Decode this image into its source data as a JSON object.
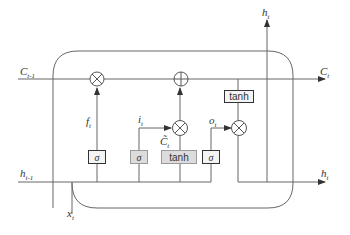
{
  "diagram": {
    "type": "LSTM cell",
    "labels": {
      "c_prev": {
        "base": "C",
        "sub": "t-1"
      },
      "c_next": {
        "base": "C",
        "sub": "t"
      },
      "h_prev": {
        "base": "h",
        "sub": "t-1"
      },
      "h_out_right": {
        "base": "h",
        "sub": "t"
      },
      "h_out_top": {
        "base": "h",
        "sub": "t"
      },
      "x_in": {
        "base": "x",
        "sub": "t"
      },
      "forget_gate": {
        "base": "f",
        "sub": "t"
      },
      "input_gate": {
        "base": "i",
        "sub": "t"
      },
      "output_gate": {
        "base": "o",
        "sub": "t"
      },
      "candidate": {
        "base": "C̃",
        "sub": "t"
      }
    },
    "boxes": {
      "sigma_forget": "σ",
      "sigma_input": "σ",
      "tanh_candidate": "tanh",
      "sigma_output": "σ",
      "tanh_cell": "tanh"
    },
    "operators": {
      "forget_multiply": "⊗",
      "cell_add": "⊕",
      "input_multiply": "⊗",
      "output_multiply": "⊗"
    },
    "colors": {
      "line": "#555555",
      "dark_box_border": "#333333",
      "gray_box_fill": "#dcdcdc"
    }
  }
}
